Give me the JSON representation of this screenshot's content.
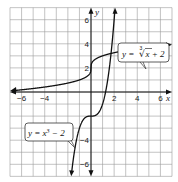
{
  "chart_data": {
    "type": "line",
    "title": "",
    "xlabel": "x",
    "ylabel": "y",
    "xlim": [
      -7,
      7
    ],
    "ylim": [
      -7,
      7
    ],
    "grid": true,
    "x_ticks": [
      -6,
      -4,
      2,
      4,
      6
    ],
    "y_ticks": [
      6,
      4,
      2,
      -4,
      -6
    ],
    "x_tick_labels": [
      "−6",
      "−4",
      "2",
      "4",
      "6"
    ],
    "y_tick_labels": [
      "6",
      "4",
      "2",
      "−4",
      "−6"
    ],
    "series": [
      {
        "name": "y = ∛x + 2",
        "label_text": "y = ∛x + 2",
        "function": "cbrt(x) + 2",
        "x_range": [
          -7,
          7
        ]
      },
      {
        "name": "y = x³ − 2",
        "label_text": "y = x³ − 2",
        "function": "x^3 - 2",
        "x_range": [
          -1.5,
          2.1
        ]
      }
    ],
    "annotations": [
      {
        "text": "y = ∛x + 2",
        "points_to_x": 4.3
      },
      {
        "text": "y = x³ − 2",
        "points_to_x": -1.1
      }
    ]
  },
  "labels": {
    "x_axis": "x",
    "y_axis": "y",
    "curve1_prefix": "y = ",
    "curve1_root": "3",
    "curve1_body": "x + 2",
    "curve2_prefix": "y = x",
    "curve2_exp": "3",
    "curve2_suffix": " − 2"
  }
}
